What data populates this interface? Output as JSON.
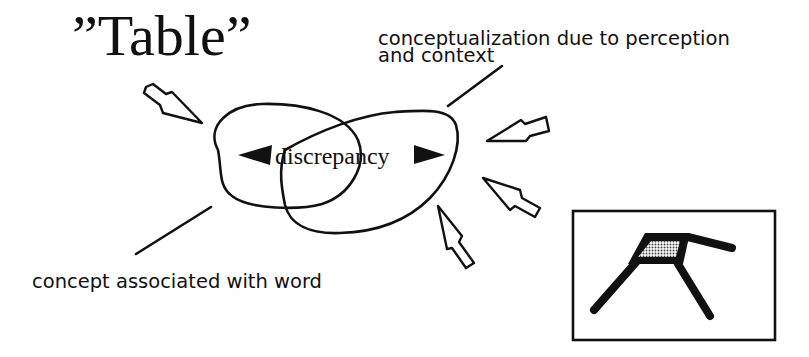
{
  "diagram": {
    "title_word": "”Table”",
    "labels": {
      "context": {
        "line1": "conceptualization due to perception",
        "line2": "and context"
      },
      "word_concept": "concept associated with word",
      "discrepancy": "discrepancy"
    },
    "shapes": {
      "left_blob": "concept-associated-with-word region",
      "right_blob": "conceptualization region",
      "left_arrowhead": "pointing left",
      "right_arrowhead": "pointing right",
      "input_arrows": [
        "from upper-left",
        "from right (upper)",
        "from right (middle)",
        "from lower-right"
      ],
      "table_picture": "framed drawing of a table with hatched top"
    },
    "colors": {
      "ink": "#111111",
      "background": "#ffffff",
      "hatch": "#9a9a9a"
    }
  }
}
